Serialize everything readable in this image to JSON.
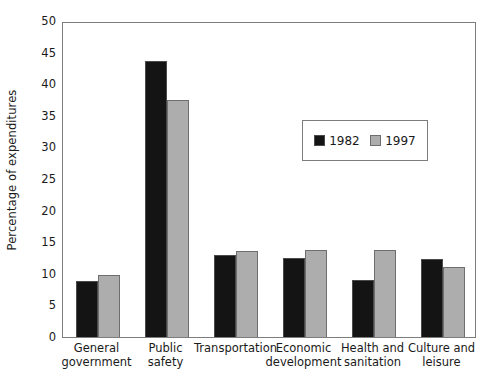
{
  "chart_data": {
    "type": "bar",
    "title": "",
    "subtitle": "",
    "xlabel": "",
    "ylabel": "Percentage of expenditures",
    "ylim": [
      0,
      50
    ],
    "yticks": [
      0,
      5,
      10,
      15,
      20,
      25,
      30,
      35,
      40,
      45,
      50
    ],
    "grid": false,
    "legend_position": "inside-upper-right",
    "categories": [
      "General government",
      "Public safety",
      "Transportation",
      "Economic development",
      "Health and sanitation",
      "Culture and leisure"
    ],
    "category_lines": [
      [
        "General",
        "government"
      ],
      [
        "Public",
        "safety"
      ],
      [
        "Transportation"
      ],
      [
        "Economic",
        "development"
      ],
      [
        "Health and",
        "sanitation"
      ],
      [
        "Culture and",
        "leisure"
      ]
    ],
    "series": [
      {
        "name": "1982",
        "color": "#141414",
        "values": [
          8.8,
          43.7,
          13.0,
          12.5,
          9.0,
          12.4
        ]
      },
      {
        "name": "1997",
        "color": "#adadad",
        "values": [
          9.8,
          37.5,
          13.6,
          13.8,
          13.7,
          11.1
        ]
      }
    ]
  },
  "legend": {
    "entries": [
      {
        "label": "1982",
        "swatch": "black-square-swatch"
      },
      {
        "label": "1997",
        "swatch": "gray-square-swatch"
      }
    ]
  },
  "axes": {
    "y_title": "Percentage of expenditures",
    "y_tick_labels": [
      "0",
      "5",
      "10",
      "15",
      "20",
      "25",
      "30",
      "35",
      "40",
      "45",
      "50"
    ]
  }
}
